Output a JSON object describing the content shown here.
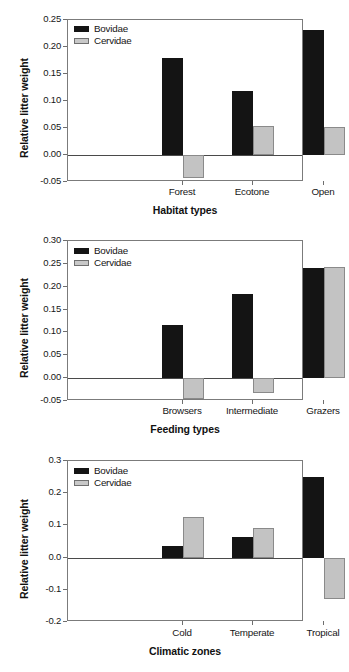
{
  "figure": {
    "series_names": [
      "Bovidae",
      "Cervidae"
    ],
    "colors": {
      "bovidae": "#141414",
      "cervidae": "#c3c3c3",
      "axis": "#7b7b7b"
    }
  },
  "chart_data": [
    {
      "type": "bar",
      "title": "",
      "xlabel": "Habitat types",
      "ylabel": "Relative litter weight",
      "categories": [
        "Forest",
        "Ecotone",
        "Open"
      ],
      "series": [
        {
          "name": "Bovidae",
          "values": [
            0.179,
            0.118,
            0.231
          ]
        },
        {
          "name": "Cervidae",
          "values": [
            -0.043,
            0.054,
            0.051
          ]
        }
      ],
      "ylim": [
        -0.05,
        0.25
      ],
      "yticks": [
        0.25,
        0.2,
        0.15,
        0.1,
        0.05,
        0.0,
        -0.05
      ],
      "ytick_labels": [
        "0.25",
        "0.20",
        "0.15",
        "0.10",
        "0.05",
        "0.00",
        "-0.05"
      ],
      "grid": false,
      "legend_position": "top-left",
      "legend": [
        "Bovidae",
        "Cervidae"
      ]
    },
    {
      "type": "bar",
      "title": "",
      "xlabel": "Feeding types",
      "ylabel": "Relative litter weight",
      "categories": [
        "Browsers",
        "Intermediate",
        "Grazers"
      ],
      "series": [
        {
          "name": "Bovidae",
          "values": [
            0.117,
            0.185,
            0.242
          ]
        },
        {
          "name": "Cervidae",
          "values": [
            -0.045,
            -0.033,
            0.244
          ]
        }
      ],
      "ylim": [
        -0.05,
        0.3
      ],
      "yticks": [
        0.3,
        0.25,
        0.2,
        0.15,
        0.1,
        0.05,
        0.0,
        -0.05
      ],
      "ytick_labels": [
        "0.30",
        "0.25",
        "0.20",
        "0.15",
        "0.10",
        "0.05",
        "0.00",
        "-0.05"
      ],
      "grid": false,
      "legend_position": "top-left",
      "legend": [
        "Bovidae",
        "Cervidae"
      ]
    },
    {
      "type": "bar",
      "title": "",
      "xlabel": "Climatic zones",
      "ylabel": "Relative litter weight",
      "categories": [
        "Cold",
        "Temperate",
        "Tropical"
      ],
      "series": [
        {
          "name": "Bovidae",
          "values": [
            0.037,
            0.064,
            0.251
          ]
        },
        {
          "name": "Cervidae",
          "values": [
            0.127,
            0.092,
            -0.13
          ]
        }
      ],
      "ylim": [
        -0.2,
        0.3
      ],
      "yticks": [
        0.3,
        0.2,
        0.1,
        0.0,
        -0.1,
        -0.2
      ],
      "ytick_labels": [
        "0.3",
        "0.2",
        "0.1",
        "0.0",
        "-0.1",
        "-0.2"
      ],
      "grid": false,
      "legend_position": "top-left",
      "legend": [
        "Bovidae",
        "Cervidae"
      ]
    }
  ]
}
